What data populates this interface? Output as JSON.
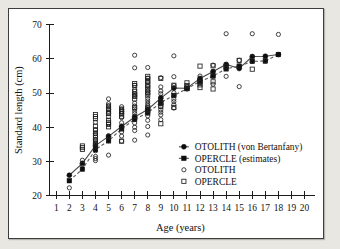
{
  "figure": {
    "background_color": "#e9e7e2",
    "panel_color": "#ffffff",
    "border_color": "#3d3d3d"
  },
  "chart_data": {
    "type": "scatter",
    "title": "",
    "xlabel": "Age (years)",
    "ylabel": "Standard length (cm)",
    "xlim": [
      0.5,
      20.5
    ],
    "ylim": [
      20,
      70
    ],
    "xticks": [
      1,
      2,
      3,
      4,
      5,
      6,
      7,
      8,
      9,
      10,
      11,
      12,
      13,
      14,
      15,
      16,
      17,
      18,
      19,
      20
    ],
    "yticks": [
      20,
      30,
      40,
      50,
      60,
      70
    ],
    "grid": false,
    "legend_position": "center-right",
    "series": [
      {
        "name": "OTOLITH (von Bertanfany)",
        "marker": "filled-circle",
        "line": "solid",
        "x": [
          2,
          3,
          4,
          5,
          6,
          7,
          8,
          9,
          10,
          11,
          12,
          13,
          14,
          15,
          16,
          17,
          18
        ],
        "y": [
          25.9,
          29.4,
          34.6,
          37.3,
          40.2,
          43.0,
          45.2,
          48.5,
          51.5,
          51.4,
          54.3,
          56.3,
          58.4,
          57.2,
          60.7,
          60.8,
          61.3
        ]
      },
      {
        "name": "OPERCLE (estimates)",
        "marker": "filled-square",
        "line": "dashed",
        "x": [
          2,
          3,
          4,
          5,
          6,
          7,
          8,
          9,
          10,
          11,
          12,
          13,
          14,
          15,
          16,
          17,
          18
        ],
        "y": [
          24.3,
          27.7,
          33.4,
          36.0,
          39.5,
          42.3,
          44.2,
          47.2,
          49.3,
          51.3,
          53.4,
          55.0,
          57.1,
          57.9,
          59.3,
          59.4,
          61.3
        ]
      },
      {
        "name": "OTOLITH",
        "marker": "open-circle",
        "line": "none",
        "points": [
          [
            2,
            22.2
          ],
          [
            3,
            29.1
          ],
          [
            3,
            30.3
          ],
          [
            4,
            30.2
          ],
          [
            4,
            30.8
          ],
          [
            4,
            31.4
          ],
          [
            4,
            33.1
          ],
          [
            4,
            34.3
          ],
          [
            4,
            35.2
          ],
          [
            4,
            36.3
          ],
          [
            4,
            38.1
          ],
          [
            4,
            39.2
          ],
          [
            4,
            41.4
          ],
          [
            5,
            31.8
          ],
          [
            5,
            36.0
          ],
          [
            5,
            37.5
          ],
          [
            5,
            41.0
          ],
          [
            5,
            43.1
          ],
          [
            5,
            44.0
          ],
          [
            5,
            45.2
          ],
          [
            5,
            46.2
          ],
          [
            5,
            46.9
          ],
          [
            5,
            48.3
          ],
          [
            6,
            35.9
          ],
          [
            6,
            37.4
          ],
          [
            6,
            38.6
          ],
          [
            6,
            39.7
          ],
          [
            6,
            40.3
          ],
          [
            6,
            41.3
          ],
          [
            6,
            42.8
          ],
          [
            6,
            44.0
          ],
          [
            6,
            44.6
          ],
          [
            6,
            45.2
          ],
          [
            6,
            46.0
          ],
          [
            7,
            36.2
          ],
          [
            7,
            39.0
          ],
          [
            7,
            40.0
          ],
          [
            7,
            41.2
          ],
          [
            7,
            42.2
          ],
          [
            7,
            43.2
          ],
          [
            7,
            44.0
          ],
          [
            7,
            44.7
          ],
          [
            7,
            45.4
          ],
          [
            7,
            46.2
          ],
          [
            7,
            47.0
          ],
          [
            7,
            49.2
          ],
          [
            7,
            49.8
          ],
          [
            7,
            51.0
          ],
          [
            7,
            52.3
          ],
          [
            7,
            57.4
          ],
          [
            7,
            61.1
          ],
          [
            8,
            37.7
          ],
          [
            8,
            40.2
          ],
          [
            8,
            42.0
          ],
          [
            8,
            43.3
          ],
          [
            8,
            44.2
          ],
          [
            8,
            45.2
          ],
          [
            8,
            45.9
          ],
          [
            8,
            46.4
          ],
          [
            8,
            47.0
          ],
          [
            8,
            47.7
          ],
          [
            8,
            48.4
          ],
          [
            8,
            49.8
          ],
          [
            8,
            50.6
          ],
          [
            8,
            52.0
          ],
          [
            8,
            53.2
          ],
          [
            8,
            54.4
          ],
          [
            8,
            57.5
          ],
          [
            9,
            42.2
          ],
          [
            9,
            43.6
          ],
          [
            9,
            44.4
          ],
          [
            9,
            45.1
          ],
          [
            9,
            46.0
          ],
          [
            9,
            46.8
          ],
          [
            9,
            47.6
          ],
          [
            9,
            48.8
          ],
          [
            9,
            49.8
          ],
          [
            9,
            50.6
          ],
          [
            9,
            51.8
          ],
          [
            9,
            54.5
          ],
          [
            10,
            45.6
          ],
          [
            10,
            46.6
          ],
          [
            10,
            47.5
          ],
          [
            10,
            48.2
          ],
          [
            10,
            49.2
          ],
          [
            10,
            50.1
          ],
          [
            10,
            51.4
          ],
          [
            10,
            52.2
          ],
          [
            10,
            54.8
          ],
          [
            10,
            60.9
          ],
          [
            11,
            51.2
          ],
          [
            11,
            52.0
          ],
          [
            12,
            53.3
          ],
          [
            12,
            54.2
          ],
          [
            12,
            55.0
          ],
          [
            13,
            52.6
          ],
          [
            13,
            55.0
          ],
          [
            13,
            56.3
          ],
          [
            13,
            58.2
          ],
          [
            14,
            54.9
          ],
          [
            14,
            57.2
          ],
          [
            14,
            58.4
          ],
          [
            14,
            67.4
          ],
          [
            15,
            51.9
          ],
          [
            15,
            57.9
          ],
          [
            15,
            59.6
          ],
          [
            16,
            59.3
          ],
          [
            16,
            60.5
          ],
          [
            16,
            67.4
          ],
          [
            17,
            59.4
          ],
          [
            18,
            67.2
          ]
        ]
      },
      {
        "name": "OPERCLE",
        "marker": "open-square",
        "line": "none",
        "points": [
          [
            3,
            33.5
          ],
          [
            3,
            34.0
          ],
          [
            3,
            34.5
          ],
          [
            4,
            35.0
          ],
          [
            4,
            35.6
          ],
          [
            4,
            36.2
          ],
          [
            4,
            36.9
          ],
          [
            4,
            37.5
          ],
          [
            4,
            38.3
          ],
          [
            4,
            39.2
          ],
          [
            4,
            40.3
          ],
          [
            4,
            42.5
          ],
          [
            4,
            43.1
          ],
          [
            4,
            43.7
          ],
          [
            5,
            40.1
          ],
          [
            5,
            40.8
          ],
          [
            5,
            41.4
          ],
          [
            5,
            42.0
          ],
          [
            5,
            44.0
          ],
          [
            5,
            44.7
          ],
          [
            5,
            45.5
          ],
          [
            5,
            46.2
          ],
          [
            6,
            35.9
          ],
          [
            6,
            43.2
          ],
          [
            6,
            43.9
          ],
          [
            6,
            44.6
          ],
          [
            6,
            45.3
          ],
          [
            7,
            45.8
          ],
          [
            7,
            48.3
          ],
          [
            7,
            49.0
          ],
          [
            7,
            49.7
          ],
          [
            7,
            50.5
          ],
          [
            7,
            52.2
          ],
          [
            7,
            52.8
          ],
          [
            8,
            44.9
          ],
          [
            8,
            45.6
          ],
          [
            8,
            49.4
          ],
          [
            8,
            50.2
          ],
          [
            8,
            51.0
          ],
          [
            8,
            51.8
          ],
          [
            8,
            52.6
          ],
          [
            8,
            53.4
          ],
          [
            8,
            54.2
          ],
          [
            8,
            54.9
          ],
          [
            9,
            41.0
          ],
          [
            9,
            46.1
          ],
          [
            9,
            47.0
          ],
          [
            9,
            54.3
          ],
          [
            10,
            45.8
          ],
          [
            10,
            52.3
          ],
          [
            11,
            51.4
          ],
          [
            11,
            52.2
          ],
          [
            11,
            53.0
          ],
          [
            12,
            51.6
          ],
          [
            12,
            52.4
          ],
          [
            12,
            53.1
          ],
          [
            12,
            57.9
          ],
          [
            13,
            51.2
          ],
          [
            13,
            53.3
          ],
          [
            13,
            58.0
          ],
          [
            14,
            57.8
          ],
          [
            15,
            59.6
          ],
          [
            16,
            57.0
          ]
        ]
      }
    ]
  },
  "legend": {
    "entries": [
      {
        "label": "OTOLITH (von Bertanfany)",
        "marker": "filled-circle",
        "line": "solid"
      },
      {
        "label": "OPERCLE (estimates)",
        "marker": "filled-square",
        "line": "solid"
      },
      {
        "label": "OTOLITH",
        "marker": "open-circle",
        "line": "none"
      },
      {
        "label": "OPERCLE",
        "marker": "open-square",
        "line": "none"
      }
    ]
  }
}
